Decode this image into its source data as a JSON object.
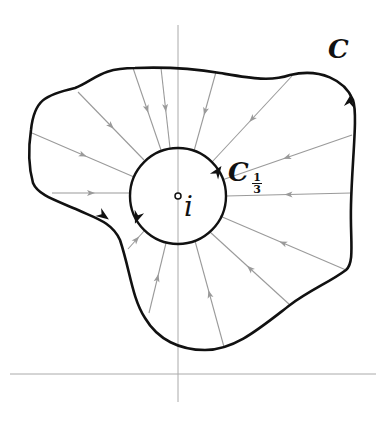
{
  "figure": {
    "colors": {
      "contour": "#111111",
      "flow_lines": "#9a9a9a",
      "axes": "#aaaaaa",
      "background": "#ffffff"
    },
    "labels": {
      "outer_contour": "C",
      "inner_contour": "C",
      "inner_subscript_num": "1",
      "inner_subscript_den": "3",
      "center_point": "i"
    },
    "axes": {
      "horizontal": {
        "x1": 10,
        "y1": 374,
        "x2": 376,
        "y2": 374
      },
      "vertical": {
        "x1": 178,
        "y1": 25,
        "x2": 178,
        "y2": 402
      }
    },
    "inner_circle": {
      "cx": 178,
      "cy": 196,
      "r": 48
    },
    "center_marker": {
      "cx": 178,
      "cy": 196,
      "r": 3
    },
    "outer_contour_path": "M 33,183 C 28,165 28,150 31,130 C 34,100 45,95 75,88 C 95,80 100,68 135,68 C 160,67 190,68 220,73 C 250,78 270,82 290,75 C 320,68 345,80 353,100 C 358,115 352,160 351,205 C 350,240 355,262 346,270 C 330,282 310,290 290,305 C 260,328 235,350 205,350 C 180,350 158,340 145,318 C 132,298 130,270 120,240 C 112,222 95,218 78,210 C 55,200 38,195 33,183 Z",
    "flow_lines": [
      {
        "x1": 32,
        "y1": 133,
        "x2": 134,
        "y2": 177
      },
      {
        "x1": 78,
        "y1": 92,
        "x2": 144,
        "y2": 160
      },
      {
        "x1": 133,
        "y1": 68,
        "x2": 161,
        "y2": 150
      },
      {
        "x1": 161,
        "y1": 68,
        "x2": 170,
        "y2": 148
      },
      {
        "x1": 216,
        "y1": 72,
        "x2": 194,
        "y2": 151
      },
      {
        "x1": 292,
        "y1": 76,
        "x2": 212,
        "y2": 162
      },
      {
        "x1": 352,
        "y1": 135,
        "x2": 222,
        "y2": 180
      },
      {
        "x1": 351,
        "y1": 193,
        "x2": 226,
        "y2": 196
      },
      {
        "x1": 346,
        "y1": 270,
        "x2": 220,
        "y2": 216
      },
      {
        "x1": 290,
        "y1": 305,
        "x2": 210,
        "y2": 232
      },
      {
        "x1": 224,
        "y1": 347,
        "x2": 195,
        "y2": 241
      },
      {
        "x1": 149,
        "y1": 313,
        "x2": 166,
        "y2": 243
      },
      {
        "x1": 128,
        "y1": 249,
        "x2": 145,
        "y2": 230
      },
      {
        "x1": 52,
        "y1": 193,
        "x2": 130,
        "y2": 193
      }
    ],
    "outer_arrows": [
      {
        "x": 104,
        "y": 216,
        "angle": 35
      },
      {
        "x": 350,
        "y": 100,
        "angle": -80
      }
    ],
    "inner_arrows": [
      {
        "x": 218,
        "y": 171,
        "angle": -55
      },
      {
        "x": 137,
        "y": 218,
        "angle": 110
      }
    ]
  }
}
